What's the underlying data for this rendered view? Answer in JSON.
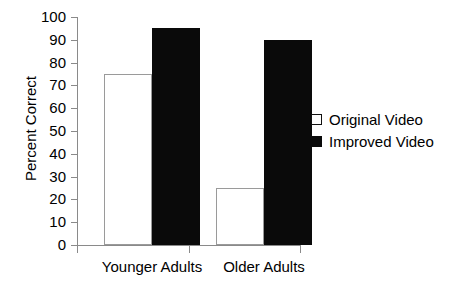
{
  "chart_data": {
    "type": "bar",
    "title": "",
    "xlabel": "",
    "ylabel": "Percent Correct",
    "categories": [
      "Younger Adults",
      "Older Adults"
    ],
    "series": [
      {
        "name": "Original Video",
        "values": [
          75,
          25
        ],
        "style": "open",
        "color": "#ffffff"
      },
      {
        "name": "Improved Video",
        "values": [
          95,
          90
        ],
        "style": "filled",
        "color": "#000000"
      }
    ],
    "ylim": [
      0,
      100
    ],
    "yticks": [
      0,
      10,
      20,
      30,
      40,
      50,
      60,
      70,
      80,
      90,
      100
    ],
    "ytick_labels": [
      "0",
      "10",
      "20",
      "30",
      "40",
      "50",
      "60",
      "70",
      "80",
      "90",
      "100"
    ],
    "grid": false,
    "legend_position": "right"
  },
  "legend": {
    "entries": [
      {
        "label": "Original Video",
        "swatch": "open-square-icon"
      },
      {
        "label": "Improved Video",
        "swatch": "filled-square-icon"
      }
    ]
  }
}
